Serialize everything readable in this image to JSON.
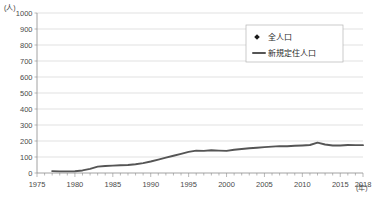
{
  "chart_data": {
    "type": "scatter",
    "title": "",
    "xlabel": "(年)",
    "ylabel": "(人)",
    "yunit_label": "(人)",
    "xunit_label": "(年)",
    "xlim": [
      1975,
      2018
    ],
    "ylim": [
      0,
      1000
    ],
    "ytick_step": 100,
    "yticks": [
      0,
      100,
      200,
      300,
      400,
      500,
      600,
      700,
      800,
      900,
      1000
    ],
    "ytick_labels": [
      "0",
      "100",
      "200",
      "300",
      "400",
      "500",
      "600",
      "700",
      "800",
      "900",
      "1000"
    ],
    "xticks": [
      1975,
      1980,
      1985,
      1990,
      1995,
      2000,
      2005,
      2010,
      2015,
      2018
    ],
    "xtick_labels": [
      "1975",
      "1980",
      "1985",
      "1990",
      "1995",
      "2000",
      "2005",
      "2010",
      "2015",
      "2018"
    ],
    "grid": true,
    "grid_axis": "y",
    "legend_position": "top-right",
    "series": [
      {
        "name": "全人口",
        "type": "scatter",
        "marker": "diamond",
        "color": "#1a1a1a",
        "points": [
          {
            "x": 1976,
            "y": 975
          },
          {
            "x": 1980,
            "y": 805
          },
          {
            "x": 1984,
            "y": 683
          },
          {
            "x": 1988,
            "y": 600
          },
          {
            "x": 1990,
            "y": 575
          },
          {
            "x": 1992,
            "y": 550
          },
          {
            "x": 1998,
            "y": 505
          },
          {
            "x": 2002,
            "y": 455
          },
          {
            "x": 2004,
            "y": 450
          },
          {
            "x": 2006,
            "y": 430
          },
          {
            "x": 2008,
            "y": 408
          },
          {
            "x": 2009,
            "y": 400
          },
          {
            "x": 2010,
            "y": 388
          },
          {
            "x": 2011,
            "y": 380
          },
          {
            "x": 2012,
            "y": 372
          },
          {
            "x": 2013,
            "y": 365
          },
          {
            "x": 2014,
            "y": 355
          },
          {
            "x": 2015,
            "y": 340
          },
          {
            "x": 2016,
            "y": 325
          },
          {
            "x": 2017,
            "y": 312
          },
          {
            "x": 2018,
            "y": 298
          }
        ]
      },
      {
        "name": "新規定住人口",
        "type": "line",
        "color": "#555555",
        "points": [
          {
            "x": 1977,
            "y": 12
          },
          {
            "x": 1978,
            "y": 10
          },
          {
            "x": 1979,
            "y": 10
          },
          {
            "x": 1980,
            "y": 11
          },
          {
            "x": 1981,
            "y": 16
          },
          {
            "x": 1982,
            "y": 26
          },
          {
            "x": 1983,
            "y": 40
          },
          {
            "x": 1984,
            "y": 44
          },
          {
            "x": 1985,
            "y": 46
          },
          {
            "x": 1986,
            "y": 48
          },
          {
            "x": 1987,
            "y": 50
          },
          {
            "x": 1988,
            "y": 55
          },
          {
            "x": 1989,
            "y": 62
          },
          {
            "x": 1990,
            "y": 72
          },
          {
            "x": 1991,
            "y": 84
          },
          {
            "x": 1992,
            "y": 96
          },
          {
            "x": 1993,
            "y": 108
          },
          {
            "x": 1994,
            "y": 120
          },
          {
            "x": 1995,
            "y": 132
          },
          {
            "x": 1996,
            "y": 140
          },
          {
            "x": 1997,
            "y": 138
          },
          {
            "x": 1998,
            "y": 142
          },
          {
            "x": 1999,
            "y": 140
          },
          {
            "x": 2000,
            "y": 138
          },
          {
            "x": 2001,
            "y": 145
          },
          {
            "x": 2002,
            "y": 150
          },
          {
            "x": 2003,
            "y": 155
          },
          {
            "x": 2004,
            "y": 158
          },
          {
            "x": 2005,
            "y": 162
          },
          {
            "x": 2006,
            "y": 165
          },
          {
            "x": 2007,
            "y": 168
          },
          {
            "x": 2008,
            "y": 167
          },
          {
            "x": 2009,
            "y": 170
          },
          {
            "x": 2010,
            "y": 172
          },
          {
            "x": 2011,
            "y": 175
          },
          {
            "x": 2012,
            "y": 190
          },
          {
            "x": 2013,
            "y": 178
          },
          {
            "x": 2014,
            "y": 172
          },
          {
            "x": 2015,
            "y": 172
          },
          {
            "x": 2016,
            "y": 175
          },
          {
            "x": 2017,
            "y": 174
          },
          {
            "x": 2018,
            "y": 174
          }
        ]
      }
    ]
  },
  "legend": {
    "items": [
      {
        "label": "全人口",
        "marker": "diamond"
      },
      {
        "label": "新規定住人口",
        "marker": "line"
      }
    ]
  }
}
